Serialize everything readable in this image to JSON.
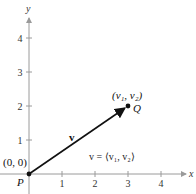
{
  "diagram": {
    "type": "vector-in-plane",
    "x_axis": {
      "label": "x",
      "ticks": [
        "1",
        "2",
        "3",
        "4"
      ],
      "range": [
        0,
        4.7
      ]
    },
    "y_axis": {
      "label": "y",
      "ticks": [
        "1",
        "2",
        "3",
        "4"
      ],
      "range": [
        0,
        4.6
      ]
    },
    "initial_point": {
      "name": "P",
      "coords_label": "(0, 0)",
      "x": 0,
      "y": 0
    },
    "terminal_point": {
      "name": "Q",
      "coords_label": "(v₁, v₂)",
      "x": 3,
      "y": 2
    },
    "vector": {
      "name": "v",
      "component_form": "v = ⟨v₁, v₂⟩"
    },
    "colors": {
      "axis": "#9a9a9a",
      "vector": "#111111",
      "text": "#222222"
    }
  }
}
